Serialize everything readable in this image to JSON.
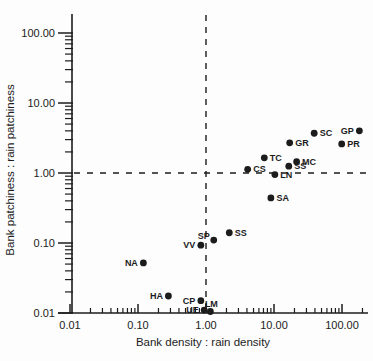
{
  "chart_data": {
    "type": "scatter",
    "title": "",
    "xlabel": "Bank density : rain density",
    "ylabel": "Bank patchiness : rain patchiness",
    "x_scale": "log",
    "y_scale": "log",
    "xlim": [
      0.01,
      250
    ],
    "ylim": [
      0.01,
      200
    ],
    "x_ticks": [
      0.01,
      0.1,
      1,
      10,
      100
    ],
    "x_tick_labels": [
      "0.01",
      "0.10",
      "1.00",
      "10.00",
      "100.00"
    ],
    "y_ticks": [
      100,
      10,
      1,
      0.1,
      0.01
    ],
    "y_tick_labels": [
      "100.00",
      "10.00",
      "1.00",
      "0.10",
      "0.01"
    ],
    "grid": false,
    "legend": "none",
    "reference_lines": [
      {
        "axis": "x",
        "value": 1.0,
        "style": "dashed"
      },
      {
        "axis": "y",
        "value": 1.0,
        "style": "dashed"
      }
    ],
    "point_color": "#1c1c1c",
    "points": [
      {
        "label": "GP",
        "x": 180,
        "y": 4.0,
        "label_side": "left"
      },
      {
        "label": "SC",
        "x": 39,
        "y": 3.7,
        "label_side": "right"
      },
      {
        "label": "PR",
        "x": 99,
        "y": 2.6,
        "label_side": "right"
      },
      {
        "label": "GR",
        "x": 17,
        "y": 2.7,
        "label_side": "right"
      },
      {
        "label": "MC",
        "x": 21.5,
        "y": 1.45,
        "label_side": "right"
      },
      {
        "label": "TC",
        "x": 7.2,
        "y": 1.65,
        "label_side": "right"
      },
      {
        "label": "SS",
        "x": 16.5,
        "y": 1.25,
        "label_side": "right"
      },
      {
        "label": "CS",
        "x": 4.1,
        "y": 1.13,
        "label_side": "right"
      },
      {
        "label": "LN",
        "x": 10.3,
        "y": 0.95,
        "label_side": "right"
      },
      {
        "label": "SA",
        "x": 9.0,
        "y": 0.44,
        "label_side": "right"
      },
      {
        "label": "SS",
        "x": 2.2,
        "y": 0.14,
        "label_side": "right"
      },
      {
        "label": "SP",
        "x": 1.3,
        "y": 0.11,
        "label_side": "left-above"
      },
      {
        "label": "VV",
        "x": 0.84,
        "y": 0.093,
        "label_side": "left"
      },
      {
        "label": "NA",
        "x": 0.12,
        "y": 0.052,
        "label_side": "left"
      },
      {
        "label": "HA",
        "x": 0.28,
        "y": 0.0175,
        "label_side": "left"
      },
      {
        "label": "CP",
        "x": 0.84,
        "y": 0.015,
        "label_side": "left"
      },
      {
        "label": "UE",
        "x": 0.94,
        "y": 0.011,
        "label_side": "left"
      },
      {
        "label": "LM",
        "x": 1.16,
        "y": 0.0105,
        "label_side": "above"
      }
    ]
  }
}
